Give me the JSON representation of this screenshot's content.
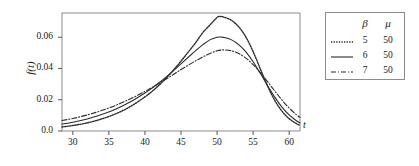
{
  "chart_data": {
    "type": "line",
    "title": "",
    "xlabel": "t",
    "ylabel": "f(t)",
    "xlim": [
      28.5,
      61.5
    ],
    "ylim": [
      0.0,
      0.0755
    ],
    "grid": false,
    "legend_position": "right-outside",
    "xticks": [
      30,
      35,
      40,
      45,
      50,
      55,
      60
    ],
    "xtick_labels": [
      "30",
      "35",
      "40",
      "45",
      "50",
      "55",
      "60"
    ],
    "yticks": [
      0.0,
      0.02,
      0.04,
      0.06
    ],
    "ytick_labels": [
      "0.0",
      "0.02",
      "0.04",
      "0.06"
    ],
    "legend_headers": [
      "β",
      "μ"
    ],
    "series": [
      {
        "name": "beta-5-mu-50",
        "beta": "5",
        "mu": "50",
        "style": "dotted",
        "color": "#2b2b2b",
        "x": [
          28.5,
          30,
          32,
          34,
          36,
          38,
          40,
          41,
          42,
          43,
          44,
          45,
          46,
          47,
          48,
          49,
          50,
          50.4,
          51,
          52,
          53,
          54,
          55,
          56,
          57,
          58,
          59,
          60,
          61,
          61.5
        ],
        "y": [
          0.0026,
          0.0035,
          0.0052,
          0.0077,
          0.0111,
          0.0157,
          0.0218,
          0.0254,
          0.0295,
          0.0341,
          0.0392,
          0.0447,
          0.0505,
          0.0563,
          0.0628,
          0.0678,
          0.0726,
          0.0733,
          0.0728,
          0.0708,
          0.0667,
          0.0601,
          0.0508,
          0.0397,
          0.0288,
          0.0196,
          0.0127,
          0.0079,
          0.0047,
          0.0036
        ]
      },
      {
        "name": "beta-6-mu-50",
        "beta": "6",
        "mu": "50",
        "style": "solid",
        "color": "#2b2b2b",
        "x": [
          28.5,
          30,
          32,
          34,
          36,
          38,
          40,
          41,
          42,
          43,
          44,
          45,
          46,
          47,
          48,
          49,
          50,
          50.6,
          51,
          52,
          53,
          54,
          55,
          56,
          57,
          58,
          59,
          60,
          61,
          61.5
        ],
        "y": [
          0.0044,
          0.0056,
          0.0077,
          0.0105,
          0.0141,
          0.0187,
          0.0243,
          0.0275,
          0.031,
          0.0348,
          0.0388,
          0.043,
          0.0472,
          0.0513,
          0.0551,
          0.0583,
          0.06,
          0.0601,
          0.0598,
          0.0583,
          0.0553,
          0.0506,
          0.0443,
          0.0369,
          0.0291,
          0.0217,
          0.0153,
          0.0103,
          0.0066,
          0.0053
        ]
      },
      {
        "name": "beta-7-mu-50",
        "beta": "7",
        "mu": "50",
        "style": "dashdot",
        "color": "#2b2b2b",
        "x": [
          28.5,
          30,
          32,
          34,
          36,
          38,
          40,
          41,
          42,
          43,
          44,
          45,
          46,
          47,
          48,
          49,
          50,
          50.6,
          51,
          52,
          53,
          54,
          55,
          56,
          57,
          58,
          59,
          60,
          61,
          61.5
        ],
        "y": [
          0.0067,
          0.008,
          0.0103,
          0.0131,
          0.0165,
          0.0206,
          0.0253,
          0.0279,
          0.0306,
          0.0334,
          0.0363,
          0.0393,
          0.0421,
          0.0448,
          0.0473,
          0.0496,
          0.0513,
          0.0518,
          0.0519,
          0.0513,
          0.0496,
          0.0466,
          0.0425,
          0.0374,
          0.0316,
          0.0256,
          0.0198,
          0.0147,
          0.0104,
          0.0087
        ]
      }
    ]
  },
  "plot_frame": {
    "left": 62,
    "top": 13,
    "right": 300,
    "bottom": 131
  }
}
